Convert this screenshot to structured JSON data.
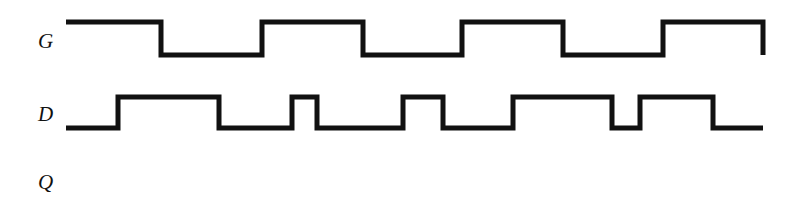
{
  "figure": {
    "type": "digital-timing-diagram",
    "background_color": "#ffffff",
    "line_color": "#111111",
    "line_width": 5,
    "width": 811,
    "height": 203
  },
  "labels": {
    "g": "G",
    "d": "D",
    "q": "Q"
  },
  "chart_data": {
    "type": "line",
    "title": "",
    "xlabel": "",
    "ylabel": "",
    "grid": false,
    "legend": "none",
    "xlim": [
      66,
      763
    ],
    "signals": [
      {
        "name": "G",
        "label": "G",
        "label_x": 38,
        "label_y": 31,
        "high_y": 22,
        "low_y": 55,
        "start_x": 66,
        "end_x": 763,
        "initial_level": "high",
        "final_level": "low",
        "ends_with_edge": true,
        "transitions": [
          161,
          262,
          363,
          462,
          563,
          663,
          763
        ],
        "levels": [
          "high",
          "low",
          "high",
          "low",
          "high",
          "low",
          "high",
          "low"
        ]
      },
      {
        "name": "D",
        "label": "D",
        "label_x": 38,
        "label_y": 104,
        "high_y": 97,
        "low_y": 128,
        "start_x": 66,
        "end_x": 763,
        "initial_level": "low",
        "final_level": "low",
        "ends_with_edge": false,
        "transitions": [
          118,
          219,
          292,
          317,
          403,
          443,
          513,
          612,
          640,
          713
        ],
        "levels": [
          "low",
          "high",
          "low",
          "high",
          "low",
          "high",
          "low",
          "high",
          "low",
          "high",
          "low"
        ]
      },
      {
        "name": "Q",
        "label": "Q",
        "label_x": 38,
        "label_y": 172,
        "high_y": 168,
        "low_y": 196,
        "start_x": 66,
        "end_x": 763,
        "initial_level": "none",
        "final_level": "none",
        "ends_with_edge": false,
        "transitions": [],
        "levels": []
      }
    ]
  }
}
